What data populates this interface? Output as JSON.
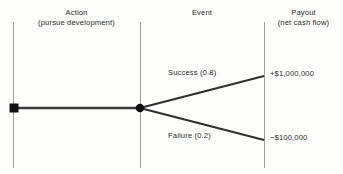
{
  "diagram": {
    "columns": [
      {
        "name": "action",
        "title": "Action",
        "subtitle": "(pursue development)"
      },
      {
        "name": "event",
        "title": "Event",
        "subtitle": ""
      },
      {
        "name": "payout",
        "title": "Payout",
        "subtitle": "(net cash flow)"
      }
    ],
    "branches": [
      {
        "name": "success",
        "label": "Success (0.8)",
        "probability": 0.8,
        "payout": "+$1,000,000"
      },
      {
        "name": "failure",
        "label": "Failure (0.2)",
        "probability": 0.2,
        "payout": "−$100,000"
      }
    ],
    "nodes": [
      {
        "name": "decision-node",
        "shape": "square"
      },
      {
        "name": "chance-node",
        "shape": "circle"
      }
    ],
    "colors": {
      "background": "#fdfdfb",
      "line": "#3a3a3a",
      "divider": "#9a9a9a",
      "text": "#2b2b2b",
      "node": "#111111"
    }
  }
}
